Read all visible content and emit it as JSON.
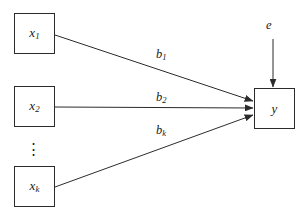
{
  "diagram": {
    "type": "path-diagram",
    "background_color": "#ffffff",
    "stroke_color": "#2b2b2b",
    "text_color": "#1a1a1a",
    "nodes": [
      {
        "id": "x1",
        "label": "x",
        "subscript": "1",
        "shape": "rectangle",
        "x": 14,
        "y": 13,
        "w": 41,
        "h": 41
      },
      {
        "id": "x2",
        "label": "x",
        "subscript": "2",
        "shape": "rectangle",
        "x": 14,
        "y": 86,
        "w": 41,
        "h": 41
      },
      {
        "id": "xk",
        "label": "x",
        "subscript": "k",
        "shape": "rectangle",
        "x": 14,
        "y": 166,
        "w": 41,
        "h": 41
      },
      {
        "id": "y",
        "label": "y",
        "subscript": "",
        "shape": "rectangle",
        "x": 254,
        "y": 88,
        "w": 41,
        "h": 41
      }
    ],
    "ellipsis": {
      "id": "vertical-dots",
      "glyph": "⋮"
    },
    "error_term": {
      "id": "e",
      "label": "e"
    },
    "edges": [
      {
        "id": "b1",
        "from": "x1",
        "to": "y",
        "label": "b",
        "subscript": "1",
        "label_x": 156,
        "label_y": 48
      },
      {
        "id": "b2",
        "from": "x2",
        "to": "y",
        "label": "b",
        "subscript": "2",
        "label_x": 156,
        "label_y": 91
      },
      {
        "id": "bk",
        "from": "xk",
        "to": "y",
        "label": "b",
        "subscript": "k",
        "label_x": 156,
        "label_y": 124
      },
      {
        "id": "e-to-y",
        "from": "e",
        "to": "y",
        "label": "",
        "subscript": ""
      }
    ]
  }
}
